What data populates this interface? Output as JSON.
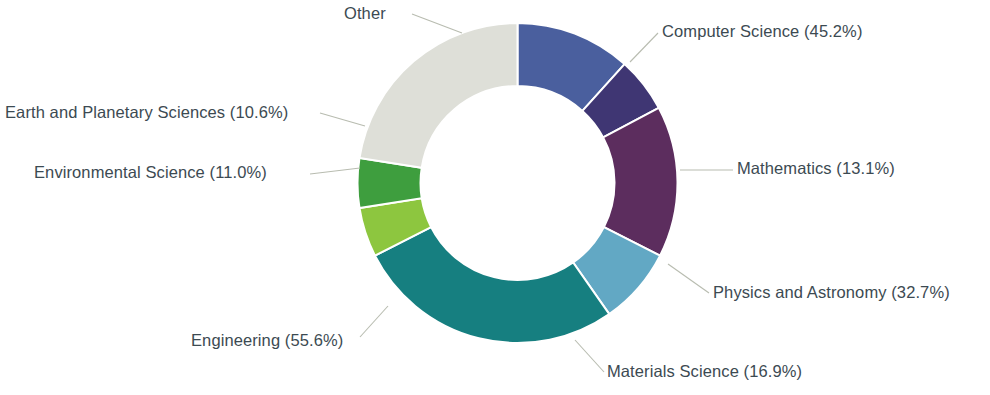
{
  "chart_data": {
    "type": "pie",
    "variant": "donut",
    "title": "",
    "subtitle": "",
    "xlabel": "",
    "ylabel": "",
    "legend_position": "callout-labels",
    "grid": false,
    "value_unit": "%",
    "note": "Percentages are shown in the callout labels; slice angles are proportional to the listed values.",
    "categories": [
      "Computer Science",
      "Mathematics",
      "Physics and Astronomy",
      "Materials Science",
      "Engineering",
      "Environmental Science",
      "Earth and Planetary Sciences",
      "Other"
    ],
    "values": [
      45.2,
      13.1,
      32.7,
      16.9,
      55.6,
      11.0,
      10.6,
      29.7
    ],
    "labels": [
      "Computer Science (45.2%)",
      "Mathematics (13.1%)",
      "Physics and Astronomy (32.7%)",
      "Materials Science (16.9%)",
      "Engineering (55.6%)",
      "Environmental Science (11.0%)",
      "Earth and Planetary Sciences (10.6%)",
      "Other"
    ],
    "colors": [
      "#4a5f9e",
      "#3f3673",
      "#5c2d5e",
      "#62a8c4",
      "#167f80",
      "#8dc63f",
      "#3e9e3e",
      "#dedfd8"
    ],
    "slices": [
      {
        "name": "Computer Science",
        "label": "Computer Science (45.2%)",
        "value": 45.2,
        "color": "#4a5f9e",
        "start_angle": 0,
        "end_angle": 42.0
      },
      {
        "name": "Mathematics",
        "label": "Mathematics (13.1%)",
        "value": 13.1,
        "color": "#3f3673",
        "start_angle": 42.0,
        "end_angle": 62.0
      },
      {
        "name": "Physics and Astronomy",
        "label": "Physics and Astronomy (32.7%)",
        "value": 32.7,
        "color": "#5c2d5e",
        "start_angle": 62.0,
        "end_angle": 117.0
      },
      {
        "name": "Materials Science",
        "label": "Materials Science (16.9%)",
        "value": 16.9,
        "color": "#62a8c4",
        "start_angle": 117.0,
        "end_angle": 145.0
      },
      {
        "name": "Engineering",
        "label": "Engineering (55.6%)",
        "value": 55.6,
        "color": "#167f80",
        "start_angle": 145.0,
        "end_angle": 243.0
      },
      {
        "name": "Environmental Science",
        "label": "Environmental Science (11.0%)",
        "value": 11.0,
        "color": "#8dc63f",
        "start_angle": 243.0,
        "end_angle": 261.0
      },
      {
        "name": "Earth and Planetary Sciences",
        "label": "Earth and Planetary Sciences (10.6%)",
        "value": 10.6,
        "color": "#3e9e3e",
        "start_angle": 261.0,
        "end_angle": 279.0
      },
      {
        "name": "Other",
        "label": "Other",
        "value": 29.7,
        "color": "#dedfd8",
        "start_angle": 279.0,
        "end_angle": 360.0
      }
    ]
  },
  "style": {
    "background": "#ffffff",
    "label_color": "#3c4a52",
    "leader_line_color": "#b8bcb0",
    "slice_separator_color": "#ffffff"
  }
}
